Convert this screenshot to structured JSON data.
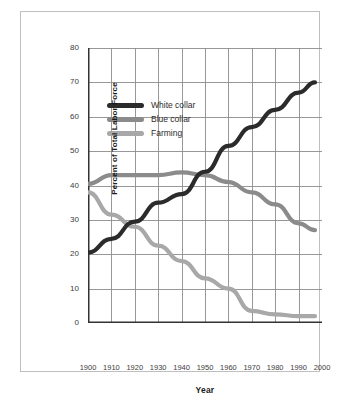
{
  "chart_data": {
    "type": "line",
    "title": "",
    "xlabel": "Year",
    "ylabel": "Percent of Total Labor Force",
    "xlim": [
      1900,
      2000
    ],
    "ylim": [
      0,
      80
    ],
    "xticks": [
      "1900",
      "1910",
      "1920",
      "1930",
      "1940",
      "1950",
      "1960",
      "1970",
      "1980",
      "1990",
      "2000"
    ],
    "yticks": [
      "0",
      "10",
      "20",
      "30",
      "40",
      "50",
      "60",
      "70",
      "80"
    ],
    "grid": true,
    "legend_position": "upper-left-inside",
    "x": [
      1900,
      1910,
      1920,
      1930,
      1940,
      1950,
      1960,
      1970,
      1980,
      1990,
      1997
    ],
    "series": [
      {
        "name": "White collar",
        "color": "#2b2b2b",
        "values": [
          20.5,
          24.5,
          29.5,
          35,
          37.5,
          44,
          51.5,
          57,
          62,
          67,
          70
        ]
      },
      {
        "name": "Blue collar",
        "color": "#8b8b8b",
        "values": [
          40.5,
          43,
          43,
          43,
          43.8,
          43,
          41,
          38,
          34.5,
          29,
          27
        ]
      },
      {
        "name": "Farming",
        "color": "#a8a8a8",
        "values": [
          38,
          31.5,
          28,
          22.5,
          18,
          13,
          10,
          3.5,
          2.5,
          2,
          2
        ]
      }
    ]
  },
  "legend": {
    "items": [
      {
        "label": "White collar",
        "color": "#2b2b2b"
      },
      {
        "label": "Blue collar",
        "color": "#8b8b8b"
      },
      {
        "label": "Farming",
        "color": "#a8a8a8"
      }
    ]
  },
  "axes": {
    "x_title": "Year",
    "y_title": "Percent of Total Labor Force"
  },
  "colors": {
    "frame_border": "#bfbfbf",
    "gridline": "#8c8c8c",
    "axis_spine": "#333333",
    "background": "#ffffff",
    "tick_text": "#3b3b3b"
  }
}
